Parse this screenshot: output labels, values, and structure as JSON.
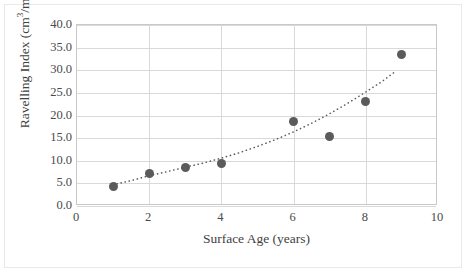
{
  "chart_data": {
    "type": "scatter",
    "title": "",
    "xlabel": "Surface Age (years)",
    "ylabel_text": "Ravelling Index (cm³/m²)",
    "ylabel_parts": {
      "base": "Ravelling Index (cm",
      "sup1": "3",
      "mid": "/m",
      "sup2": "2",
      "end": ")"
    },
    "x": [
      1,
      2,
      3,
      4,
      6,
      7,
      8,
      9
    ],
    "values": [
      4.2,
      7.2,
      8.6,
      9.4,
      18.7,
      15.4,
      23.2,
      33.5
    ],
    "series": [
      {
        "name": "Ravelling Index",
        "marker": "circle",
        "color": "#5b5b5b",
        "points": [
          {
            "x": 1,
            "y": 4.2
          },
          {
            "x": 2,
            "y": 7.2
          },
          {
            "x": 3,
            "y": 8.6
          },
          {
            "x": 4,
            "y": 9.4
          },
          {
            "x": 6,
            "y": 18.7
          },
          {
            "x": 7,
            "y": 15.4
          },
          {
            "x": 8,
            "y": 23.2
          },
          {
            "x": 9,
            "y": 33.5
          }
        ]
      }
    ],
    "trendline": {
      "style": "dotted",
      "color": "#5b5b5b",
      "type": "exponential",
      "points": [
        {
          "x": 1,
          "y": 4.3
        },
        {
          "x": 1.5,
          "y": 5.2
        },
        {
          "x": 2,
          "y": 6.3
        },
        {
          "x": 2.5,
          "y": 7.2
        },
        {
          "x": 3,
          "y": 8.2
        },
        {
          "x": 3.5,
          "y": 9.1
        },
        {
          "x": 4,
          "y": 10.2
        },
        {
          "x": 4.5,
          "y": 11.4
        },
        {
          "x": 5,
          "y": 12.8
        },
        {
          "x": 5.5,
          "y": 14.3
        },
        {
          "x": 6,
          "y": 16.0
        },
        {
          "x": 6.5,
          "y": 17.9
        },
        {
          "x": 7,
          "y": 20.0
        },
        {
          "x": 7.5,
          "y": 22.3
        },
        {
          "x": 8,
          "y": 24.8
        },
        {
          "x": 8.5,
          "y": 27.4
        },
        {
          "x": 8.85,
          "y": 29.5
        }
      ]
    },
    "xlim": [
      0,
      10
    ],
    "ylim": [
      0,
      40
    ],
    "xticks": [
      "0",
      "2",
      "4",
      "6",
      "8",
      "10"
    ],
    "xtick_values": [
      0,
      2,
      4,
      6,
      8,
      10
    ],
    "yticks": [
      "0.0",
      "5.0",
      "10.0",
      "15.0",
      "20.0",
      "25.0",
      "30.0",
      "35.0",
      "40.0"
    ],
    "ytick_values": [
      0,
      5,
      10,
      15,
      20,
      25,
      30,
      35,
      40
    ],
    "grid": {
      "horizontal": true,
      "vertical": true
    },
    "legend": {
      "visible": false,
      "position": "none"
    },
    "colors": {
      "marker": "#5b5b5b",
      "gridline": "#d9d9d9",
      "axis": "#c9c9c9",
      "text": "#4a4a4a",
      "background": "#ffffff"
    }
  }
}
